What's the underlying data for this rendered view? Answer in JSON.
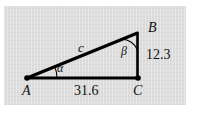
{
  "figure": {
    "type": "right-triangle-diagram",
    "background_color": "#ffffff",
    "panel_color": "#dcdcdc",
    "stroke_color": "#000000",
    "vertices": [
      {
        "name": "A",
        "label": "A",
        "x": 27,
        "y": 78,
        "marker": "dot"
      },
      {
        "name": "B",
        "label": "B",
        "x": 137,
        "y": 33,
        "marker": "none"
      },
      {
        "name": "C",
        "label": "C",
        "x": 138,
        "y": 78,
        "marker": "dot"
      }
    ],
    "sides": [
      {
        "name": "hypotenuse-AB",
        "label": "c",
        "from": "A",
        "to": "B",
        "value": null
      },
      {
        "name": "side-BC",
        "label": "12.3",
        "from": "B",
        "to": "C",
        "value": 12.3
      },
      {
        "name": "side-AC",
        "label": "31.6",
        "from": "A",
        "to": "C",
        "value": 31.6
      }
    ],
    "angles": [
      {
        "name": "angle-at-A",
        "label": "α",
        "vertex": "A"
      },
      {
        "name": "angle-at-B",
        "label": "β",
        "vertex": "B"
      }
    ]
  }
}
